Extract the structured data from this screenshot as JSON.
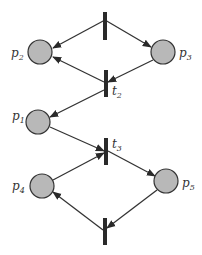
{
  "diagram": {
    "type": "petri-net",
    "colors": {
      "place_fill": "#b8b8b8",
      "stroke": "#333333",
      "transition": "#2a2a2a"
    },
    "places": [
      {
        "id": "p1",
        "label": "p",
        "sub": "1",
        "cx": 38,
        "cy": 122
      },
      {
        "id": "p2",
        "label": "p",
        "sub": "2",
        "cx": 40,
        "cy": 52
      },
      {
        "id": "p3",
        "label": "p",
        "sub": "3",
        "cx": 163,
        "cy": 52
      },
      {
        "id": "p4",
        "label": "p",
        "sub": "4",
        "cx": 42,
        "cy": 186
      },
      {
        "id": "p5",
        "label": "p",
        "sub": "5",
        "cx": 166,
        "cy": 181
      }
    ],
    "transitions": [
      {
        "id": "t1",
        "label": "",
        "x": 105,
        "y1": 12,
        "y2": 40
      },
      {
        "id": "t2",
        "label": "t",
        "sub": "2",
        "x": 106,
        "y1": 70,
        "y2": 97
      },
      {
        "id": "t3",
        "label": "t",
        "sub": "3",
        "x": 106,
        "y1": 138,
        "y2": 165
      },
      {
        "id": "t4",
        "label": "",
        "x": 105,
        "y1": 218,
        "y2": 245
      }
    ],
    "arcs": [
      {
        "from": "t1",
        "to": "p2"
      },
      {
        "from": "t1",
        "to": "p3"
      },
      {
        "from": "p3",
        "to": "t2"
      },
      {
        "from": "t2",
        "to": "p2"
      },
      {
        "from": "t2",
        "to": "p1"
      },
      {
        "from": "p1",
        "to": "t3"
      },
      {
        "from": "p4",
        "to": "t3"
      },
      {
        "from": "t3",
        "to": "p5"
      },
      {
        "from": "p5",
        "to": "t4"
      },
      {
        "from": "t4",
        "to": "p4"
      }
    ]
  },
  "labels": {
    "p1": "p",
    "p1_sub": "1",
    "p2": "p",
    "p2_sub": "2",
    "p3": "p",
    "p3_sub": "3",
    "p4": "p",
    "p4_sub": "4",
    "p5": "p",
    "p5_sub": "5",
    "t2": "t",
    "t2_sub": "2",
    "t3": "t",
    "t3_sub": "3"
  }
}
